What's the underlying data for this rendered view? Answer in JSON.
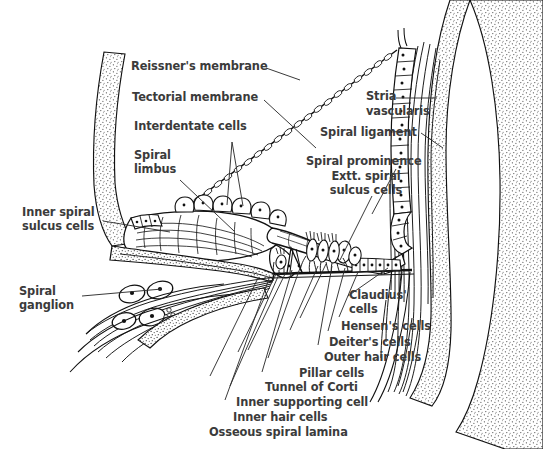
{
  "figure": {
    "background_color": "#ffffff",
    "label_color": "#3b3b3b",
    "ink_color": "#1a1a1a"
  },
  "labels": {
    "reissners_membrane": "Reissner's membrane",
    "tectorial_membrane": "Tectorial membrane",
    "interdentate_cells": "Interdentate cells",
    "spiral_limbus_line1": "Spiral",
    "spiral_limbus_line2": "limbus",
    "inner_spiral_sulcus_line1": "Inner spiral",
    "inner_spiral_sulcus_line2": "sulcus cells",
    "spiral_ganglion_line1": "Spiral",
    "spiral_ganglion_line2": "ganglion",
    "stria_vascularis_line1": "Stria",
    "stria_vascularis_line2": "vascularis",
    "spiral_ligament": "Spiral ligament",
    "spiral_prominence": "Spiral prominence",
    "ext_spiral_sulcus_line1": "Extt. spiral",
    "ext_spiral_sulcus_line2": "sulcus cells",
    "claudius_cells_line1": "Claudius'",
    "claudius_cells_line2": "cells",
    "hensens_cells": "Hensen's cells",
    "deiters_cells": "Deiter's cells",
    "outer_hair_cells": "Outer hair cells",
    "pillar_cells": "Pillar cells",
    "tunnel_of_corti": "Tunnel of Corti",
    "inner_supporting_cell": "Inner supporting cell",
    "inner_hair_cells": "Inner hair cells",
    "osseous_spiral_lamina": "Osseous spiral lamina"
  },
  "structures": [
    {
      "name": "reissners-membrane",
      "kind": "beaded-membrane"
    },
    {
      "name": "tectorial-membrane",
      "kind": "tapered-flap"
    },
    {
      "name": "interdentate-cells",
      "kind": "cell-row"
    },
    {
      "name": "spiral-limbus",
      "kind": "fibrous-wedge"
    },
    {
      "name": "inner-spiral-sulcus-cells",
      "kind": "epithelium"
    },
    {
      "name": "spiral-ganglion",
      "kind": "neuron-cluster"
    },
    {
      "name": "stria-vascularis",
      "kind": "vascular-epithelium"
    },
    {
      "name": "spiral-ligament",
      "kind": "fibrous-band"
    },
    {
      "name": "spiral-prominence",
      "kind": "bulge"
    },
    {
      "name": "external-spiral-sulcus-cells",
      "kind": "epithelium"
    },
    {
      "name": "claudius-cells",
      "kind": "cell-row"
    },
    {
      "name": "hensens-cells",
      "kind": "cell-group"
    },
    {
      "name": "deiters-cells",
      "kind": "supporting-cells"
    },
    {
      "name": "outer-hair-cells",
      "kind": "hair-cells"
    },
    {
      "name": "pillar-cells",
      "kind": "pillar-pair"
    },
    {
      "name": "tunnel-of-corti",
      "kind": "triangular-space"
    },
    {
      "name": "inner-supporting-cell",
      "kind": "supporting-cell"
    },
    {
      "name": "inner-hair-cells",
      "kind": "hair-cells"
    },
    {
      "name": "osseous-spiral-lamina",
      "kind": "bony-shelf"
    },
    {
      "name": "basilar-membrane",
      "kind": "membrane"
    },
    {
      "name": "otic-capsule-bone",
      "kind": "stippled-bone"
    }
  ]
}
